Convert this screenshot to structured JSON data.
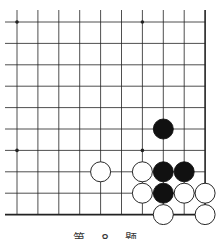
{
  "puzzle": {
    "caption": "第 8 题",
    "board": {
      "origin_x": 17,
      "origin_y": 22,
      "spacing_x": 20.9,
      "spacing_y": 21.4,
      "cols": 10,
      "rows": 10,
      "right_edge": true,
      "bottom_edge": true,
      "line_color": "#222222",
      "star_points": [
        [
          0,
          0
        ],
        [
          6,
          0
        ],
        [
          0,
          6
        ],
        [
          6,
          6
        ]
      ],
      "black_stones": [
        [
          7,
          5
        ],
        [
          7,
          7
        ],
        [
          8,
          7
        ],
        [
          7,
          8
        ]
      ],
      "white_stones": [
        [
          4,
          7
        ],
        [
          6,
          7
        ],
        [
          6,
          8
        ],
        [
          8,
          8
        ],
        [
          9,
          8
        ],
        [
          7,
          9
        ],
        [
          9,
          9
        ]
      ]
    }
  }
}
